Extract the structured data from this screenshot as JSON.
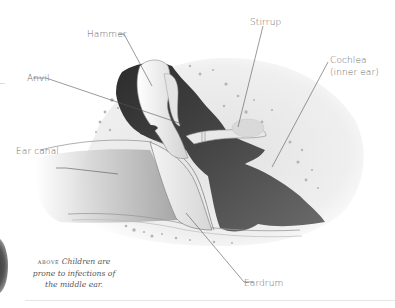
{
  "diagram": {
    "labels": [
      {
        "id": "hammer",
        "text": "Hammer"
      },
      {
        "id": "anvil",
        "text": "Anvil"
      },
      {
        "id": "stirrup",
        "text": "Stirrup"
      },
      {
        "id": "cochlea",
        "text": "Cochlea"
      },
      {
        "id": "cochlea_sub",
        "text": "(inner ear)"
      },
      {
        "id": "ear_canal",
        "text": "Ear canal"
      },
      {
        "id": "eardrum",
        "text": "Eardrum"
      }
    ],
    "colors": {
      "background": "#ffffff",
      "bone_fill": "#ececec",
      "cavity_dark": "#3a3a3a",
      "leader_line": "#555555",
      "label_text": "#6a6a6a"
    }
  },
  "caption": {
    "lead": "above",
    "text": "Children are prone to infections of the middle ear."
  }
}
